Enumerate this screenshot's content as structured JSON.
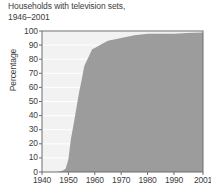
{
  "chart_data": {
    "type": "area",
    "title": "Households with television sets,\n1946–2001",
    "xlabel": "",
    "ylabel": "Percentage",
    "xlim": [
      1940,
      2001
    ],
    "ylim": [
      0,
      100
    ],
    "grid": true,
    "legend": null,
    "xticks": [
      "1940",
      "1950",
      "1960",
      "1970",
      "1980",
      "1990",
      "2001"
    ],
    "xtick_values": [
      1940,
      1950,
      1960,
      1970,
      1980,
      1990,
      2001
    ],
    "yticks": [
      "0",
      "10",
      "20",
      "30",
      "40",
      "50",
      "60",
      "70",
      "80",
      "90",
      "100"
    ],
    "ytick_values": [
      0,
      10,
      20,
      30,
      40,
      50,
      60,
      70,
      80,
      90,
      100
    ],
    "series": [
      {
        "name": "Households with television sets",
        "x": [
          1946,
          1947,
          1948,
          1949,
          1950,
          1951,
          1952,
          1953,
          1954,
          1955,
          1956,
          1957,
          1958,
          1959,
          1960,
          1962,
          1965,
          1970,
          1975,
          1980,
          1985,
          1990,
          1995,
          2001
        ],
        "values": [
          0.2,
          0.5,
          1,
          2.5,
          9,
          24,
          34,
          45,
          56,
          65,
          75,
          79,
          83,
          87,
          88,
          90,
          93,
          95,
          97,
          98,
          98,
          98,
          98.5,
          99
        ]
      }
    ],
    "colors": {
      "area_fill": "#9c9c9c",
      "plot_background": "#f2f2f2",
      "gridline": "#ffffff",
      "axis": "#6e6e6e",
      "text": "#3d3d3d"
    }
  }
}
